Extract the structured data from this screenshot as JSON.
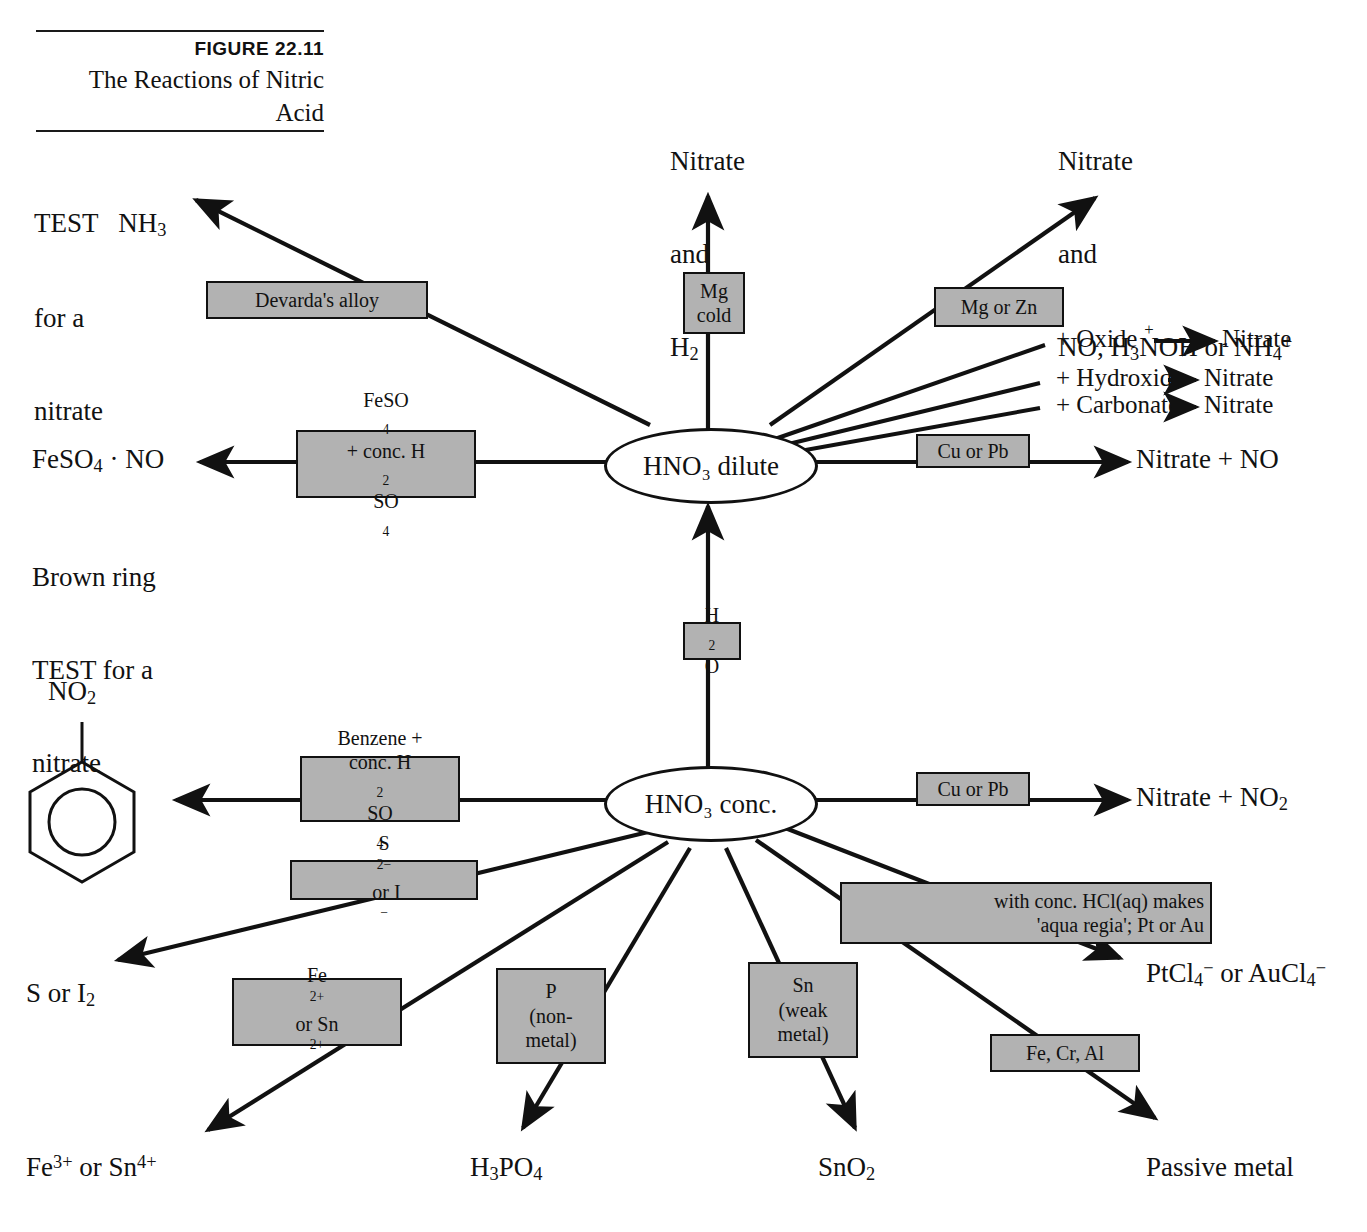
{
  "figure": {
    "number": "FIGURE 22.11",
    "title_line1": "The Reactions of Nitric",
    "title_line2": "Acid"
  },
  "colors": {
    "box_fill": "#b2b2b2",
    "stroke": "#111111",
    "background": "#ffffff"
  },
  "nodes": {
    "dilute": "HNO₃ dilute",
    "conc": "HNO₃ conc."
  },
  "diagram": {
    "type": "reaction-flow-diagram",
    "center_nodes": [
      "HNO₃ dilute",
      "HNO₃ conc."
    ],
    "link_label": "H₂O"
  },
  "labels": {
    "test_nitrate": "TEST   NH₃\nfor a\nnitrate",
    "test_nitrate_l1": "TEST   NH",
    "test_nitrate_l1_sub": "3",
    "test_nitrate_l2": "for a",
    "test_nitrate_l3": "nitrate",
    "nitrate_h2_l1": "Nitrate",
    "nitrate_h2_l2": "and",
    "nitrate_h2_l3": "H",
    "nitrate_h2_l3_sub": "2",
    "nitrate_no_nh4_l1": "Nitrate",
    "nitrate_no_nh4_l2": "and",
    "nitrate_no_nh4_l3a": "NO, H",
    "nitrate_no_nh4_l3b": "3",
    "nitrate_no_nh4_l3c": "N",
    "nitrate_no_nh4_l3_plus": "+",
    "nitrate_no_nh4_l3d": "OH or NH",
    "nitrate_no_nh4_l3e": "4",
    "nitrate_no_nh4_l3f": "+",
    "feso4_no": "FeSO₄ · NO",
    "feso4_no_a": "FeSO",
    "feso4_no_sub": "4",
    "feso4_no_b": " · NO",
    "brown_ring_l1": "Brown ring",
    "brown_ring_l2": "TEST for a",
    "brown_ring_l3": "nitrate",
    "nitrate_plus_no": "Nitrate + NO",
    "nitrate_plus_no2_a": "Nitrate + NO",
    "nitrate_plus_no2_sub": "2",
    "no2_group": "NO",
    "no2_group_sub": "2",
    "s_or_i2_a": "S or I",
    "s_or_i2_sub": "2",
    "fe3_sn4_a": "Fe",
    "fe3_sn4_sup1": "3+",
    "fe3_sn4_b": " or Sn",
    "fe3_sn4_sup2": "4+",
    "h3po4_a": "H",
    "h3po4_sub1": "3",
    "h3po4_b": "PO",
    "h3po4_sub2": "4",
    "sno2_a": "SnO",
    "sno2_sub": "2",
    "passive_metal": "Passive metal",
    "ptcl4_a": "PtCl",
    "ptcl4_sub": "4",
    "ptcl4_sup": "−",
    "ptcl4_b": " or AuCl",
    "ptcl4_sub2": "4",
    "ptcl4_sup2": "−"
  },
  "right_list": [
    {
      "reagent": "+ Oxide",
      "product": "Nitrate"
    },
    {
      "reagent": "+ Hydroxide",
      "product": "Nitrate"
    },
    {
      "reagent": "+ Carbonate",
      "product": "Nitrate"
    }
  ],
  "boxes": {
    "devardas_alloy": [
      "Devarda's alloy"
    ],
    "mg_cold": [
      "Mg",
      "cold"
    ],
    "mg_or_zn": [
      "Mg or Zn"
    ],
    "cu_or_pb_dilute": [
      "Cu or Pb"
    ],
    "feso4_h2so4": [
      "FeSO4",
      "+ conc. H2SO4"
    ],
    "feso4_h2so4_l1_a": "FeSO",
    "feso4_h2so4_l1_sub": "4",
    "feso4_h2so4_l2_a": "+ conc. H",
    "feso4_h2so4_l2_sub1": "2",
    "feso4_h2so4_l2_b": "SO",
    "feso4_h2so4_l2_sub2": "4",
    "h2o": [
      "H2O"
    ],
    "h2o_a": "H",
    "h2o_sub": "2",
    "h2o_b": "O",
    "benzene": [
      "Benzene +",
      "conc. H2SO4"
    ],
    "benzene_l1": "Benzene +",
    "benzene_l2_a": "conc. H",
    "benzene_l2_sub1": "2",
    "benzene_l2_b": "SO",
    "benzene_l2_sub2": "4",
    "cu_or_pb_conc": [
      "Cu or Pb"
    ],
    "s2_or_i": [
      "S2- or I-"
    ],
    "s2_or_i_a": "S",
    "s2_or_i_sup1": "2−",
    "s2_or_i_b": " or I",
    "s2_or_i_sup2": "−",
    "fe2_sn2_l1_a": "Fe",
    "fe2_sn2_l1_sup": "2+",
    "fe2_sn2_l2_a": "or Sn",
    "fe2_sn2_l2_sup": "2+",
    "p_nonmetal": [
      "P",
      "(non-",
      "metal)"
    ],
    "sn_weak": [
      "Sn",
      "(weak",
      "metal)"
    ],
    "aqua_regia": [
      "with conc. HCl(aq) makes",
      "'aqua regia'; Pt or Au"
    ],
    "fe_cr_al": [
      "Fe, Cr, Al"
    ]
  }
}
